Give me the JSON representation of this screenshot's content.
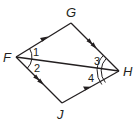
{
  "figure": {
    "type": "quadrilateral-with-diagonal",
    "vertices": {
      "F": {
        "label": "F",
        "x": 16,
        "y": 57
      },
      "G": {
        "label": "G",
        "x": 71,
        "y": 23
      },
      "H": {
        "label": "H",
        "x": 119,
        "y": 71
      },
      "J": {
        "label": "J",
        "x": 62,
        "y": 103
      }
    },
    "segments": [
      {
        "from": "F",
        "to": "G",
        "marking": "single-arrow"
      },
      {
        "from": "G",
        "to": "H",
        "marking": "double-arrow"
      },
      {
        "from": "F",
        "to": "J",
        "marking": "double-arrow"
      },
      {
        "from": "J",
        "to": "H",
        "marking": "single-arrow"
      },
      {
        "from": "F",
        "to": "H",
        "marking": "none"
      }
    ],
    "angles": [
      {
        "label": "1",
        "vertex": "F",
        "between": [
          "FG",
          "FH"
        ],
        "arcs": 1
      },
      {
        "label": "2",
        "vertex": "F",
        "between": [
          "FH",
          "FJ"
        ],
        "arcs": 1
      },
      {
        "label": "3",
        "vertex": "H",
        "between": [
          "HG",
          "HF"
        ],
        "arcs": 2
      },
      {
        "label": "4",
        "vertex": "H",
        "between": [
          "HF",
          "HJ"
        ],
        "arcs": 2
      }
    ],
    "stroke_color": "#231f20"
  }
}
